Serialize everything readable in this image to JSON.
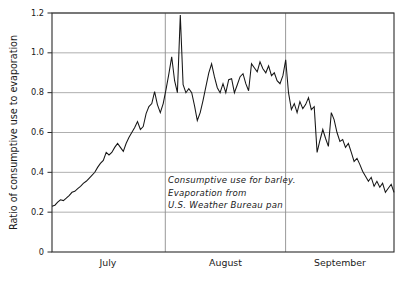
{
  "chart_data": {
    "type": "line",
    "title": "",
    "xlabel": "",
    "ylabel": "Ratio of consumptive use to evaporation",
    "ylim": [
      0,
      1.2
    ],
    "xlim": [
      0,
      92
    ],
    "grid": true,
    "legend": null,
    "ytick_labels": [
      "0",
      "0.2",
      "0.4",
      "0.6",
      "0.8",
      "1.0",
      "1.2"
    ],
    "ytick_values": [
      0,
      0.2,
      0.4,
      0.6,
      0.8,
      1.0,
      1.2
    ],
    "xtick_labels": [
      "July",
      "August",
      "September"
    ],
    "month_boundaries": [
      0,
      31,
      62,
      92
    ],
    "annotation_lines": [
      "Consumptive use for barley.",
      "Evaporation from",
      "U.S. Weather Bureau pan"
    ],
    "series": [
      {
        "name": "Ratio of consumptive use to evaporation",
        "color": "#161616",
        "x": [
          0,
          1,
          2,
          3,
          4,
          5,
          6,
          7,
          8,
          9,
          10,
          11,
          12,
          13,
          14,
          15,
          16,
          17,
          18,
          19,
          20,
          21,
          22,
          23,
          24,
          25,
          26,
          27,
          28,
          29,
          30,
          31,
          32,
          33,
          34,
          35,
          36,
          37,
          38,
          39,
          40,
          41,
          42,
          43,
          44,
          45,
          46,
          47,
          48,
          49,
          50,
          51,
          52,
          53,
          54,
          55,
          56,
          57,
          58,
          59,
          60,
          61,
          62,
          63,
          64,
          65,
          66,
          67,
          68,
          69,
          70,
          71,
          72,
          73,
          74,
          75,
          76,
          77,
          78,
          79,
          80,
          81,
          82,
          83,
          84,
          85,
          86,
          87,
          88,
          89,
          90,
          91,
          92
        ],
        "values": [
          0.23,
          0.235,
          0.25,
          0.262,
          0.258,
          0.27,
          0.283,
          0.3,
          0.305,
          0.318,
          0.33,
          0.345,
          0.355,
          0.37,
          0.385,
          0.4,
          0.425,
          0.445,
          0.46,
          0.5,
          0.487,
          0.5,
          0.525,
          0.545,
          0.525,
          0.505,
          0.545,
          0.575,
          0.6,
          0.625,
          0.655,
          0.615,
          0.63,
          0.695,
          0.73,
          0.745,
          0.805,
          0.74,
          0.7,
          0.745,
          0.815,
          0.895,
          0.98,
          0.86,
          0.8,
          1.19,
          0.84,
          0.8,
          0.82,
          0.8,
          0.735,
          0.66,
          0.7,
          0.76,
          0.83,
          0.9,
          0.945,
          0.88,
          0.825,
          0.8,
          0.845,
          0.8,
          0.865,
          0.87,
          0.8,
          0.84,
          0.88,
          0.895,
          0.845,
          0.81,
          0.945,
          0.925,
          0.905,
          0.955,
          0.92,
          0.9,
          0.935,
          0.885,
          0.9,
          0.86,
          0.845,
          0.885,
          0.965,
          0.8,
          0.715,
          0.745,
          0.7,
          0.755,
          0.72,
          0.74,
          0.775,
          0.715,
          0.73
        ]
      }
    ],
    "series_continued": {
      "note_x": [
        93,
        94,
        95,
        96,
        97,
        98,
        99,
        100,
        101,
        102,
        103,
        104,
        105,
        106,
        107,
        108,
        109,
        110,
        111,
        112,
        113,
        114,
        115,
        116,
        117,
        118,
        119,
        120
      ],
      "note_values": [
        0.5,
        0.56,
        0.615,
        0.57,
        0.53,
        0.7,
        0.665,
        0.6,
        0.555,
        0.565,
        0.525,
        0.545,
        0.5,
        0.455,
        0.47,
        0.44,
        0.405,
        0.38,
        0.355,
        0.375,
        0.33,
        0.355,
        0.325,
        0.345,
        0.3,
        0.32,
        0.34,
        0.3
      ]
    }
  },
  "plot": {
    "left": 52,
    "right": 394,
    "top": 13,
    "bottom": 252,
    "y_axis_title": "Ratio of consumptive use to evaporation"
  }
}
